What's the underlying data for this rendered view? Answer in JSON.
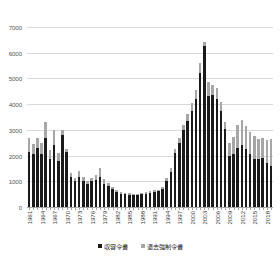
{
  "chart_data": {
    "type": "bar",
    "subtype": "stacked-column",
    "title": "",
    "xlabel": "",
    "ylabel": "",
    "ylim": [
      0,
      7000
    ],
    "ytick_step": 1000,
    "yticks": [
      0,
      1000,
      2000,
      3000,
      4000,
      5000,
      6000,
      7000
    ],
    "ytick_labels": [
      "0",
      "1000",
      "2000",
      "3000",
      "4000",
      "5000",
      "6000",
      "7000"
    ],
    "grid": true,
    "legend_position": "bottom",
    "xtick_label_rotation": -90,
    "xtick_label_interval": 3,
    "colors": {
      "series_detention": "#1a1a1a",
      "series_deportation": "#a6a6a6",
      "gridline": "#d9d9d9",
      "axis": "#a6a6a6",
      "text": "#595959",
      "background": "#ffffff"
    },
    "categories": [
      "1961",
      "1962",
      "1963",
      "1964",
      "1965",
      "1966",
      "1967",
      "1968",
      "1969",
      "1970",
      "1971",
      "1972",
      "1973",
      "1974",
      "1975",
      "1976",
      "1977",
      "1978",
      "1979",
      "1980",
      "1981",
      "1982",
      "1983",
      "1984",
      "1985",
      "1986",
      "1987",
      "1988",
      "1989",
      "1990",
      "1991",
      "1992",
      "1993",
      "1994",
      "1995",
      "1996",
      "1997",
      "1998",
      "1999",
      "2000",
      "2001",
      "2002",
      "2003",
      "2004",
      "2005",
      "2006",
      "2007",
      "2008",
      "2009",
      "2010",
      "2011",
      "2012",
      "2013",
      "2014",
      "2015",
      "2016",
      "2017",
      "2018",
      "2019"
    ],
    "xtick_labels_shown": [
      "1961",
      "1964",
      "1967",
      "1970",
      "1973",
      "1976",
      "1979",
      "1982",
      "1985",
      "1988",
      "1991",
      "1994",
      "1997",
      "2000",
      "2003",
      "2006",
      "2009",
      "2012",
      "2015",
      "2018"
    ],
    "series": [
      {
        "name": "収容令書",
        "color": "#1a1a1a",
        "values": [
          2150,
          2050,
          2300,
          2050,
          2700,
          1850,
          2400,
          1800,
          2800,
          2150,
          1150,
          1000,
          1150,
          1000,
          900,
          1000,
          1050,
          1150,
          900,
          800,
          700,
          600,
          520,
          500,
          480,
          450,
          460,
          500,
          520,
          560,
          600,
          620,
          700,
          1000,
          1350,
          2100,
          2500,
          3000,
          3350,
          3750,
          4200,
          5200,
          6250,
          4300,
          4350,
          4200,
          3750,
          3050,
          2000,
          2050,
          2300,
          2400,
          2250,
          2050,
          1850,
          1850,
          1900,
          1700,
          1600
        ]
      },
      {
        "name": "退去強制令書",
        "color": "#a6a6a6",
        "values": [
          520,
          400,
          400,
          450,
          600,
          350,
          600,
          300,
          200,
          100,
          180,
          130,
          250,
          150,
          100,
          120,
          200,
          380,
          200,
          130,
          90,
          80,
          60,
          60,
          60,
          50,
          60,
          60,
          50,
          60,
          60,
          60,
          90,
          120,
          150,
          170,
          180,
          200,
          260,
          300,
          350,
          420,
          150,
          550,
          400,
          420,
          330,
          260,
          500,
          680,
          900,
          1000,
          900,
          850,
          900,
          780,
          800,
          900,
          1050
        ]
      }
    ]
  },
  "legend": {
    "items": [
      {
        "label": "収容令書",
        "color": "#1a1a1a"
      },
      {
        "label": "退去強制令書",
        "color": "#a6a6a6"
      }
    ]
  }
}
